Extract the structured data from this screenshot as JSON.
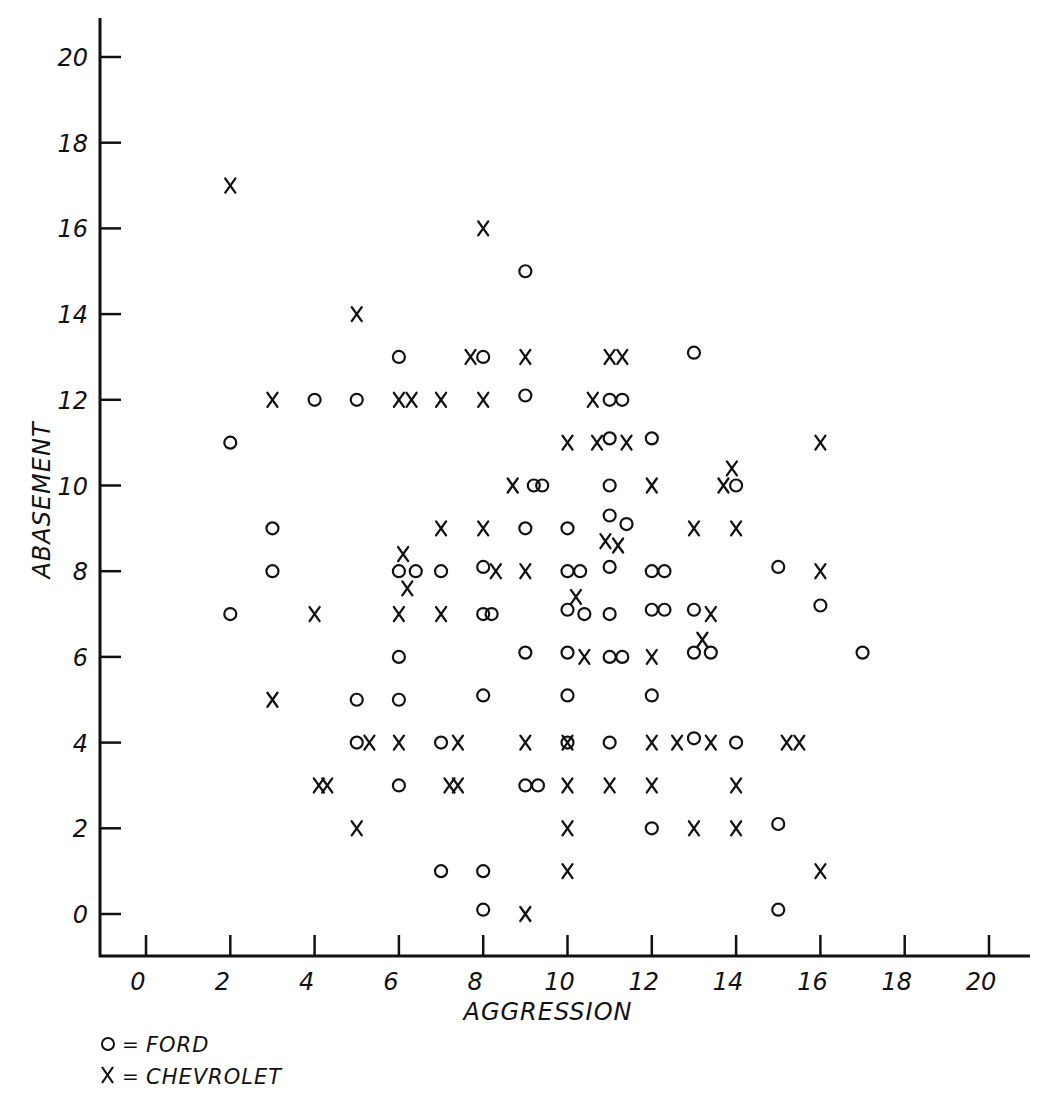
{
  "chart_data": {
    "type": "scatter",
    "title": "",
    "xlabel": "AGGRESSION",
    "ylabel": "ABASEMENT",
    "xlim": [
      0,
      20
    ],
    "ylim": [
      0,
      20
    ],
    "x_ticks": [
      0,
      2,
      4,
      6,
      8,
      10,
      12,
      14,
      16,
      18,
      20
    ],
    "y_ticks": [
      0,
      2,
      4,
      6,
      8,
      10,
      12,
      14,
      16,
      18,
      20
    ],
    "grid": false,
    "legend_position": "bottom-left",
    "legend": [
      {
        "symbol": "O",
        "label": "FORD"
      },
      {
        "symbol": "X",
        "label": "CHEVROLET"
      }
    ],
    "series": [
      {
        "name": "FORD",
        "marker": "circle",
        "points": [
          [
            9,
            15
          ],
          [
            6,
            13
          ],
          [
            8,
            13
          ],
          [
            13,
            13.1
          ],
          [
            4,
            12
          ],
          [
            5,
            12
          ],
          [
            9,
            12.1
          ],
          [
            11,
            12
          ],
          [
            11.3,
            12
          ],
          [
            2,
            11
          ],
          [
            11,
            11.1
          ],
          [
            12,
            11.1
          ],
          [
            9.2,
            10
          ],
          [
            9.4,
            10
          ],
          [
            11,
            10
          ],
          [
            14,
            10
          ],
          [
            3,
            9
          ],
          [
            9,
            9
          ],
          [
            10,
            9
          ],
          [
            11,
            9.3
          ],
          [
            11.4,
            9.1
          ],
          [
            3,
            8
          ],
          [
            6,
            8
          ],
          [
            6.4,
            8
          ],
          [
            7,
            8
          ],
          [
            8,
            8.1
          ],
          [
            10,
            8
          ],
          [
            10.3,
            8
          ],
          [
            11,
            8.1
          ],
          [
            12,
            8
          ],
          [
            12.3,
            8
          ],
          [
            15,
            8.1
          ],
          [
            2,
            7
          ],
          [
            8,
            7
          ],
          [
            8.2,
            7
          ],
          [
            10,
            7.1
          ],
          [
            10.4,
            7
          ],
          [
            11,
            7
          ],
          [
            12,
            7.1
          ],
          [
            12.3,
            7.1
          ],
          [
            13,
            7.1
          ],
          [
            16,
            7.2
          ],
          [
            6,
            6
          ],
          [
            9,
            6.1
          ],
          [
            10,
            6.1
          ],
          [
            11,
            6
          ],
          [
            11.3,
            6
          ],
          [
            13,
            6.1
          ],
          [
            13.4,
            6.1
          ],
          [
            17,
            6.1
          ],
          [
            5,
            5
          ],
          [
            6,
            5
          ],
          [
            8,
            5.1
          ],
          [
            10,
            5.1
          ],
          [
            12,
            5.1
          ],
          [
            5,
            4
          ],
          [
            7,
            4
          ],
          [
            10,
            4
          ],
          [
            11,
            4
          ],
          [
            13,
            4.1
          ],
          [
            14,
            4
          ],
          [
            6,
            3
          ],
          [
            9,
            3
          ],
          [
            9.3,
            3
          ],
          [
            12,
            2
          ],
          [
            15,
            2.1
          ],
          [
            7,
            1
          ],
          [
            8,
            1
          ],
          [
            8,
            0.1
          ],
          [
            15,
            0.1
          ]
        ]
      },
      {
        "name": "CHEVROLET",
        "marker": "x",
        "points": [
          [
            2,
            17
          ],
          [
            8,
            16
          ],
          [
            5,
            14
          ],
          [
            7.7,
            13
          ],
          [
            9,
            13
          ],
          [
            11,
            13
          ],
          [
            11.3,
            13
          ],
          [
            3,
            12
          ],
          [
            6,
            12
          ],
          [
            6.3,
            12
          ],
          [
            7,
            12
          ],
          [
            8,
            12
          ],
          [
            10.6,
            12
          ],
          [
            10,
            11
          ],
          [
            10.7,
            11
          ],
          [
            11.4,
            11
          ],
          [
            16,
            11
          ],
          [
            8.7,
            10
          ],
          [
            12,
            10
          ],
          [
            13.7,
            10
          ],
          [
            13.9,
            10.4
          ],
          [
            7,
            9
          ],
          [
            8,
            9
          ],
          [
            13,
            9
          ],
          [
            14,
            9
          ],
          [
            6.1,
            8.4
          ],
          [
            6.2,
            7.6
          ],
          [
            8.3,
            8
          ],
          [
            9,
            8
          ],
          [
            10.9,
            8.7
          ],
          [
            11.2,
            8.6
          ],
          [
            16,
            8
          ],
          [
            4,
            7
          ],
          [
            6,
            7
          ],
          [
            7,
            7
          ],
          [
            10.2,
            7.4
          ],
          [
            13.4,
            7
          ],
          [
            13.2,
            6.4
          ],
          [
            12,
            6
          ],
          [
            10.4,
            6
          ],
          [
            3,
            5
          ],
          [
            5.3,
            4
          ],
          [
            6,
            4
          ],
          [
            7.4,
            4
          ],
          [
            9,
            4
          ],
          [
            10,
            4
          ],
          [
            12,
            4
          ],
          [
            12.6,
            4
          ],
          [
            13.4,
            4
          ],
          [
            15.2,
            4
          ],
          [
            15.5,
            4
          ],
          [
            4.1,
            3
          ],
          [
            4.3,
            3
          ],
          [
            7.2,
            3
          ],
          [
            7.4,
            3
          ],
          [
            10,
            3
          ],
          [
            11,
            3
          ],
          [
            12,
            3
          ],
          [
            14,
            3
          ],
          [
            5,
            2
          ],
          [
            10,
            2
          ],
          [
            13,
            2
          ],
          [
            14,
            2
          ],
          [
            10,
            1
          ],
          [
            16,
            1
          ],
          [
            9,
            0
          ]
        ]
      }
    ]
  },
  "style": {
    "ink_color": "#111111",
    "background": "#ffffff"
  }
}
